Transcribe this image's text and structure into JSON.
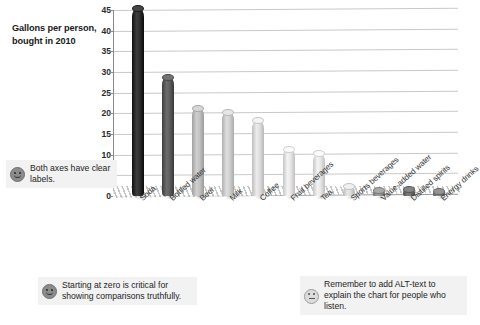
{
  "chart_data": {
    "type": "bar",
    "title": "Gallons per person, bought in 2010",
    "xlabel": "",
    "ylabel": "Gallons per person, bought in 2010",
    "ylim": [
      0,
      45
    ],
    "yticks": [
      0,
      5,
      10,
      15,
      20,
      25,
      30,
      35,
      40,
      45
    ],
    "grid": true,
    "legend": "none",
    "style": "3d-cylinder-bars",
    "categories": [
      "Soda",
      "Bottled water",
      "Beer",
      "Milk",
      "Coffee",
      "Fruit beverages",
      "Tea",
      "Sports beverages",
      "Value-added water",
      "Distilled spirits",
      "Energy drinks"
    ],
    "values": [
      45.5,
      29,
      21.5,
      20.5,
      18.5,
      11.5,
      10.5,
      2.5,
      1.5,
      1.8,
      1.3
    ],
    "bar_colors": [
      "#2b2b2b",
      "#5a5a5a",
      "#bdbdbd",
      "#cccccc",
      "#dadada",
      "#e2e2e2",
      "#e2e2e2",
      "#d6d6d6",
      "#8f8f8f",
      "#6b6b6b",
      "#7a7a7a"
    ]
  },
  "title": {
    "line1": "Gallons per person,",
    "line2": "bought in 2010"
  },
  "axis": {
    "ytick_labels": [
      "45",
      "40",
      "35",
      "30",
      "25",
      "20",
      "15",
      "10",
      "5",
      "0"
    ]
  },
  "notes": [
    {
      "id": "axes",
      "icon": "smiley-face-icon",
      "mood": "happy",
      "text": "Both axes have clear labels."
    },
    {
      "id": "zero",
      "icon": "smiley-face-icon",
      "mood": "happy",
      "text": "Starting at zero is critical for showing comparisons truthfully."
    },
    {
      "id": "alt",
      "icon": "neutral-face-icon",
      "mood": "neutral",
      "text": "Remember to add ALT-text to explain the chart for people who listen."
    }
  ]
}
